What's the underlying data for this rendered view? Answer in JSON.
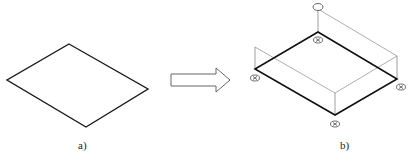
{
  "figure": {
    "panel_a": {
      "label": "a)",
      "shape": "parallelogram-plate",
      "stroke": "#1a1a1a",
      "points": [
        [
          69,
          44
        ],
        [
          148,
          89
        ],
        [
          86,
          127
        ],
        [
          7,
          80
        ]
      ]
    },
    "arrow": {
      "direction": "right",
      "stroke": "#555555",
      "fill": "#ffffff"
    },
    "panel_b": {
      "label": "b)",
      "shape": "plate-with-support-frame",
      "stroke_heavy": "#111111",
      "stroke_light": "#777777",
      "plate": [
        [
          318,
          32
        ],
        [
          397,
          79
        ],
        [
          335,
          115
        ],
        [
          255,
          69
        ]
      ],
      "posts": [
        {
          "base": [
            318,
            32
          ],
          "top": [
            318,
            9
          ]
        },
        {
          "base": [
            255,
            69
          ],
          "top": [
            255,
            47
          ]
        },
        {
          "base": [
            397,
            79
          ],
          "top": [
            397,
            56
          ]
        },
        {
          "base": [
            335,
            115
          ],
          "top": [
            335,
            93
          ]
        }
      ],
      "supports": [
        {
          "name": "support-top",
          "x": 318,
          "y": 40
        },
        {
          "name": "support-left",
          "x": 255,
          "y": 78
        },
        {
          "name": "support-right",
          "x": 401,
          "y": 87
        },
        {
          "name": "support-bottom",
          "x": 335,
          "y": 124
        }
      ],
      "top_marker": {
        "x": 318,
        "y": 7
      }
    }
  }
}
